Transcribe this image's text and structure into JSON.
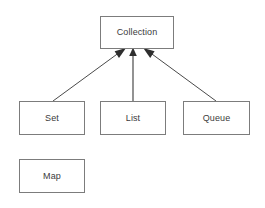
{
  "diagram": {
    "kind": "class-hierarchy-diagram",
    "background_color": "#ffffff",
    "box_border_color": "#7c7c7c",
    "box_fill_color": "#ffffff",
    "label_color": "#3b3b3b",
    "edge_color": "#4a4a4a",
    "nodes": [
      {
        "id": "collection",
        "label": "Collection",
        "x": 100,
        "y": 16,
        "width": 74,
        "height": 33
      },
      {
        "id": "set",
        "label": "Set",
        "x": 19,
        "y": 101,
        "width": 66,
        "height": 34
      },
      {
        "id": "list",
        "label": "List",
        "x": 100,
        "y": 101,
        "width": 66,
        "height": 34
      },
      {
        "id": "queue",
        "label": "Queue",
        "x": 183,
        "y": 101,
        "width": 67,
        "height": 34
      },
      {
        "id": "map",
        "label": "Map",
        "x": 19,
        "y": 159,
        "width": 66,
        "height": 34
      }
    ],
    "edges": [
      {
        "id": "set-to-collection",
        "from": "set",
        "to": "collection",
        "arrowhead": "filled-triangle",
        "x1": 53,
        "y1": 101,
        "x2": 120,
        "y2": 52
      },
      {
        "id": "list-to-collection",
        "from": "list",
        "to": "collection",
        "arrowhead": "filled-triangle",
        "x1": 133,
        "y1": 101,
        "x2": 133,
        "y2": 52
      },
      {
        "id": "queue-to-collection",
        "from": "queue",
        "to": "collection",
        "arrowhead": "filled-triangle",
        "x1": 216,
        "y1": 101,
        "x2": 149,
        "y2": 52
      }
    ]
  }
}
